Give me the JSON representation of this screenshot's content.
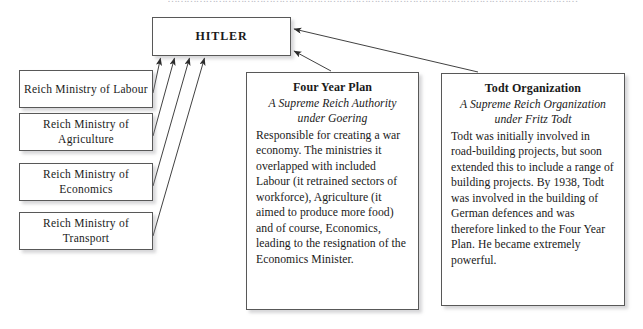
{
  "page": {
    "bleed_text": "…………………………………………………………………………………………………………………",
    "background_color": "#ffffff",
    "line_color": "#585858"
  },
  "diagram": {
    "type": "hierarchy-flow",
    "root": {
      "id": "hitler",
      "title": "HITLER"
    },
    "ministries": [
      {
        "id": "ministry-labour",
        "label": "Reich Ministry of Labour"
      },
      {
        "id": "ministry-agriculture",
        "label": "Reich Ministry of Agriculture"
      },
      {
        "id": "ministry-economics",
        "label": "Reich Ministry of Economics"
      },
      {
        "id": "ministry-transport",
        "label": "Reich Ministry of Transport"
      }
    ],
    "panels": [
      {
        "id": "four-year-plan",
        "title": "Four Year Plan",
        "subtitle": "A Supreme Reich Authority under Goering",
        "body": "Responsible for creating a war economy. The ministries it overlapped with included Labour (it retrained sectors of workforce), Agriculture (it aimed to produce more food) and of course, Economics, leading to the resignation of the Economics Minister."
      },
      {
        "id": "todt-organization",
        "title": "Todt Organization",
        "subtitle": "A Supreme Reich Organization under Fritz Todt",
        "body": "Todt was initially involved in road-building projects, but soon extended this to include a range of building projects. By 1938, Todt was involved in the building of German defences and was therefore linked to the Four Year Plan. He became extremely powerful."
      }
    ],
    "connections": [
      {
        "id": "arrow-labour-to-hitler",
        "from": "ministry-labour",
        "to": "hitler"
      },
      {
        "id": "arrow-agriculture-to-hitler",
        "from": "ministry-agriculture",
        "to": "hitler"
      },
      {
        "id": "arrow-economics-to-hitler",
        "from": "ministry-economics",
        "to": "hitler"
      },
      {
        "id": "arrow-transport-to-hitler",
        "from": "ministry-transport",
        "to": "hitler"
      },
      {
        "id": "arrow-fouryear-to-hitler",
        "from": "four-year-plan",
        "to": "hitler"
      },
      {
        "id": "arrow-todt-to-hitler",
        "from": "todt-organization",
        "to": "hitler"
      }
    ]
  }
}
